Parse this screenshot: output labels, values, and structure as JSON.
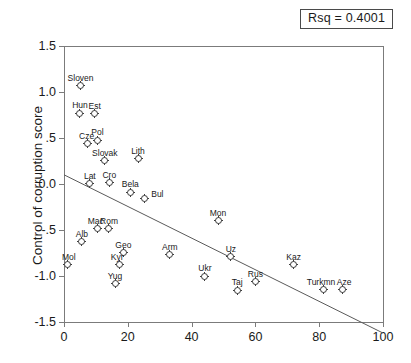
{
  "annotation": {
    "rsq_label": "Rsq = 0.4001"
  },
  "chart_data": {
    "type": "scatter",
    "title": "",
    "xlabel": "",
    "ylabel": "Control of corruption score",
    "xlim": [
      0,
      100
    ],
    "ylim": [
      -1.5,
      1.5
    ],
    "xticks": [
      0,
      20,
      40,
      60,
      80,
      100
    ],
    "xticklabels": [
      "0",
      "20",
      "40",
      "60",
      "80",
      "100"
    ],
    "yticks": [
      1.5,
      1.0,
      0.5,
      0.0,
      -0.5,
      -1.0,
      -1.5
    ],
    "yticklabels": [
      "1.5",
      "1.0",
      ".5",
      "0.0",
      "-.5",
      "-1.0",
      "-1.5"
    ],
    "grid": false,
    "legend": false,
    "marker": "circle-with-cross",
    "annotations": [
      "Rsq = 0.4001"
    ],
    "fit_line": {
      "type": "linear",
      "r_squared": 0.4001,
      "intercept": 0.1,
      "slope": -0.0172,
      "x_start": 0,
      "y_start": 0.1,
      "x_end": 100,
      "y_end": -1.62
    },
    "points": [
      {
        "label": "Sloven",
        "x": 5.2,
        "y": 1.07,
        "lx": 0,
        "ly": -13
      },
      {
        "label": "Hun",
        "x": 5.0,
        "y": 0.77,
        "lx": 0,
        "ly": -13
      },
      {
        "label": "Est",
        "x": 9.6,
        "y": 0.765,
        "lx": 0,
        "ly": -13
      },
      {
        "label": "Cze",
        "x": 7.4,
        "y": 0.435,
        "lx": -1,
        "ly": -13
      },
      {
        "label": "Pol",
        "x": 10.5,
        "y": 0.475,
        "lx": 0,
        "ly": -13
      },
      {
        "label": "Slovak",
        "x": 12.8,
        "y": 0.255,
        "lx": 0,
        "ly": -13
      },
      {
        "label": "Lith",
        "x": 23.2,
        "y": 0.275,
        "lx": 0,
        "ly": -13
      },
      {
        "label": "Lat",
        "x": 8.1,
        "y": 0.005,
        "lx": 0,
        "ly": -13
      },
      {
        "label": "Cro",
        "x": 14.2,
        "y": 0.015,
        "lx": 0,
        "ly": -13
      },
      {
        "label": "Bela",
        "x": 20.8,
        "y": -0.09,
        "lx": 0,
        "ly": -13
      },
      {
        "label": "Bul",
        "x": 25.2,
        "y": -0.155,
        "lx": 13,
        "ly": -9
      },
      {
        "label": "Mon",
        "x": 48.3,
        "y": -0.4,
        "lx": 0,
        "ly": -13
      },
      {
        "label": "Mac",
        "x": 10.6,
        "y": -0.485,
        "lx": -2,
        "ly": -13
      },
      {
        "label": "Rom",
        "x": 13.8,
        "y": -0.485,
        "lx": 1,
        "ly": -13
      },
      {
        "label": "Alb",
        "x": 5.6,
        "y": -0.625,
        "lx": 0,
        "ly": -13
      },
      {
        "label": "Mol",
        "x": 1.2,
        "y": -0.875,
        "lx": 1,
        "ly": -13
      },
      {
        "label": "Geo",
        "x": 18.6,
        "y": -0.745,
        "lx": 0,
        "ly": -13
      },
      {
        "label": "Kyr",
        "x": 17.3,
        "y": -0.875,
        "lx": -2,
        "ly": -13
      },
      {
        "label": "Yug",
        "x": 16.3,
        "y": -1.085,
        "lx": -1,
        "ly": -13
      },
      {
        "label": "Arm",
        "x": 33.2,
        "y": -0.77,
        "lx": 0,
        "ly": -13
      },
      {
        "label": "Ukr",
        "x": 44.2,
        "y": -1.005,
        "lx": 0,
        "ly": -13
      },
      {
        "label": "Uz",
        "x": 52.3,
        "y": -0.79,
        "lx": 0,
        "ly": -13
      },
      {
        "label": "Taj",
        "x": 54.3,
        "y": -1.155,
        "lx": 0,
        "ly": -13
      },
      {
        "label": "Rus",
        "x": 60.0,
        "y": -1.06,
        "lx": 0,
        "ly": -13
      },
      {
        "label": "Kaz",
        "x": 72.0,
        "y": -0.875,
        "lx": 0,
        "ly": -13
      },
      {
        "label": "Turkmn",
        "x": 81.2,
        "y": -1.15,
        "lx": -2,
        "ly": -13
      },
      {
        "label": "Aze",
        "x": 87.2,
        "y": -1.15,
        "lx": 2,
        "ly": -13
      }
    ]
  }
}
